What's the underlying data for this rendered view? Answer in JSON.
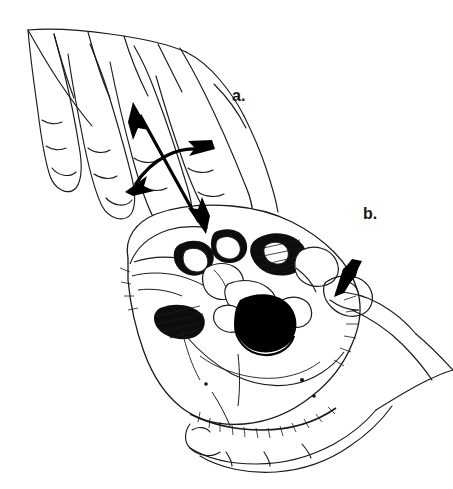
{
  "figure": {
    "background_color": "#ffffff",
    "ink_color": "#000000",
    "label_color": "#161616",
    "width": 453,
    "height": 489,
    "style": "pen-and-ink line drawing, black on white"
  },
  "labels": [
    {
      "id": "a",
      "text": "a.",
      "x": 232,
      "y": 88
    },
    {
      "id": "b",
      "text": "b.",
      "x": 363,
      "y": 206
    }
  ],
  "annotations": {
    "straight_double_arrow": {
      "name": "anteroposterior-double-arrow",
      "type": "double-headed straight arrow",
      "from": {
        "x": 133,
        "y": 102
      },
      "to": {
        "x": 205,
        "y": 233
      },
      "stroke_width": 3
    },
    "curved_double_arrow": {
      "name": "transverse-curved-double-arrow",
      "type": "double-headed curved arrow",
      "from": {
        "x": 127,
        "y": 190
      },
      "control": {
        "x": 163,
        "y": 148
      },
      "to": {
        "x": 213,
        "y": 148
      },
      "stroke_width": 3
    },
    "wedge_arrow": {
      "name": "thumb-pressure-wedge-arrow",
      "type": "solid wedge arrow",
      "tip": {
        "x": 334,
        "y": 296
      },
      "tail": {
        "x": 358,
        "y": 262
      }
    }
  },
  "anatomy": {
    "skull": {
      "name": "skull-base",
      "view": "inferior / norma basalis",
      "features": [
        {
          "name": "foramen-magnum",
          "shape": "filled oval",
          "cx": 262,
          "cy": 320,
          "rx": 26,
          "ry": 25
        },
        {
          "name": "occipital-condyle-left"
        },
        {
          "name": "occipital-condyle-right"
        },
        {
          "name": "jugular-foramen"
        },
        {
          "name": "carotid-canal"
        },
        {
          "name": "mastoid-process"
        },
        {
          "name": "styloid-process"
        },
        {
          "name": "pterygoid-plate"
        },
        {
          "name": "hard-palate"
        },
        {
          "name": "zygomatic-arch"
        },
        {
          "name": "temporal-fossa"
        }
      ]
    },
    "examining_hand": {
      "name": "examining-hand",
      "position": "upper-left, fingers extended toward skull base",
      "digits": [
        "index",
        "middle",
        "ring",
        "little"
      ]
    },
    "supporting_hand": {
      "name": "supporting-hand",
      "position": "lower-right, cradling skull from below",
      "digits": [
        "thumb",
        "fingers"
      ]
    }
  }
}
